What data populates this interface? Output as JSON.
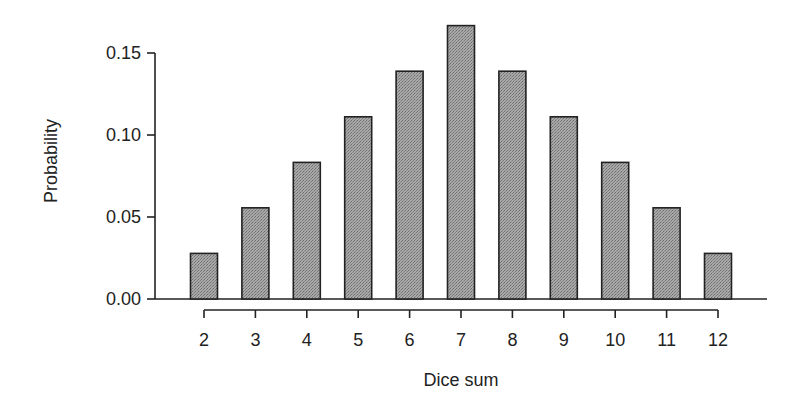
{
  "chart_data": {
    "type": "bar",
    "title": "",
    "xlabel": "Dice sum",
    "ylabel": "Probability",
    "categories": [
      "2",
      "3",
      "4",
      "5",
      "6",
      "7",
      "8",
      "9",
      "10",
      "11",
      "12"
    ],
    "values": [
      0.0278,
      0.0556,
      0.0833,
      0.1111,
      0.1389,
      0.1667,
      0.1389,
      0.1111,
      0.0833,
      0.0556,
      0.0278
    ],
    "ylim": [
      0,
      0.15
    ],
    "yticks": [
      "0.00",
      "0.05",
      "0.10",
      "0.15"
    ],
    "grid": false,
    "legend": null,
    "bar_fill": "#9a9a9a",
    "bar_edge": "#222222"
  }
}
